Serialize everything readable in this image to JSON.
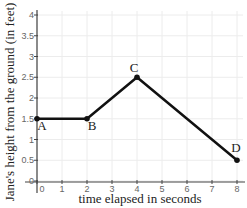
{
  "chart_data": {
    "type": "line",
    "title": "",
    "xlabel": "time elapsed in seconds",
    "ylabel": "Jane's height from the ground (in feet)",
    "xlim": [
      0,
      8
    ],
    "ylim": [
      0,
      4
    ],
    "x_ticks": [
      "0",
      "1",
      "2",
      "3",
      "4",
      "5",
      "6",
      "7",
      "8"
    ],
    "y_ticks": [
      "0",
      "0.5",
      "1",
      "1.5",
      "2",
      "2.5",
      "3",
      "3.5",
      "4"
    ],
    "grid": true,
    "series": [
      {
        "name": "Jane's height",
        "points": [
          {
            "label": "A",
            "x": 0,
            "y": 1.5
          },
          {
            "label": "B",
            "x": 2,
            "y": 1.5
          },
          {
            "label": "C",
            "x": 4,
            "y": 2.5
          },
          {
            "label": "D",
            "x": 8,
            "y": 0.5
          }
        ]
      }
    ]
  }
}
